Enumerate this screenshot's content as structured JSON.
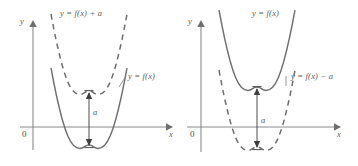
{
  "figure": {
    "stroke_colors": {
      "curve": "#6e6e70",
      "axis": "#8a8a8c",
      "text": "#58585a"
    }
  },
  "panels": [
    {
      "id": "left-panel",
      "description": "Upward vertical shift by a",
      "axis": {
        "y_label": "y",
        "x_label": "x",
        "origin_label": "0"
      },
      "curves": [
        {
          "name": "shifted-curve",
          "style": "dashed",
          "label": "y = f(x) + a",
          "label_x": 60,
          "label_y": 9,
          "vertex_y": 92
        },
        {
          "name": "base-curve",
          "style": "solid",
          "label": "y = f(x)",
          "label_x": 128,
          "label_y": 75,
          "vertex_y": 146
        }
      ],
      "shift_arrow": {
        "name": "shift-measure-a",
        "label": "a",
        "label_x": 93,
        "label_y": 108
      }
    },
    {
      "id": "right-panel",
      "description": "Downward vertical shift by a",
      "axis": {
        "y_label": "y",
        "x_label": "x",
        "origin_label": "0"
      },
      "curves": [
        {
          "name": "base-curve",
          "style": "solid",
          "label": "y = f(x)",
          "label_x": 73,
          "label_y": 9,
          "vertex_y": 88
        },
        {
          "name": "shifted-curve",
          "style": "dashed",
          "label": "y = f(x) − a",
          "label_x": 112,
          "label_y": 75,
          "vertex_y": 148
        }
      ],
      "shift_arrow": {
        "name": "shift-measure-a",
        "label": "a",
        "label_x": 82,
        "label_y": 116
      }
    }
  ]
}
